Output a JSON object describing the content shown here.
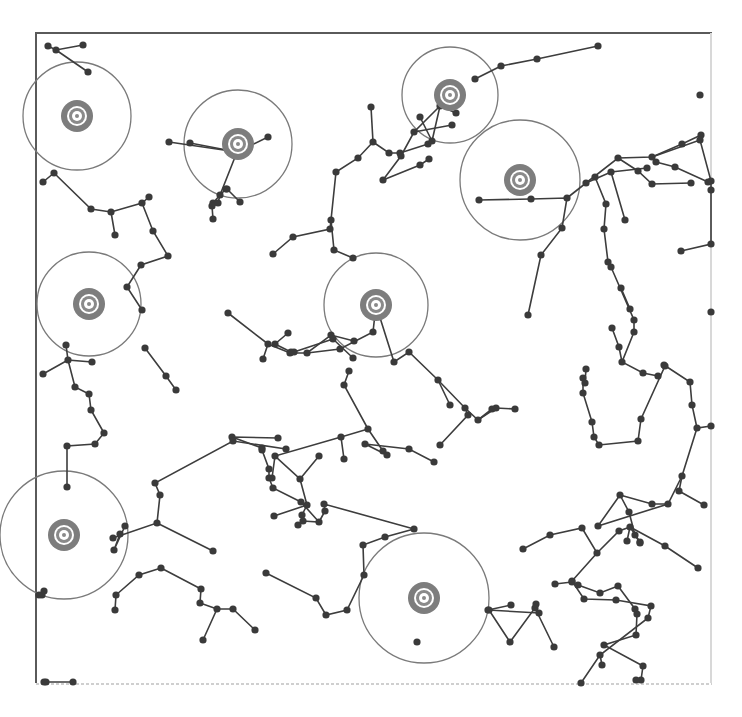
{
  "diagram": {
    "type": "network-tree-with-coverage",
    "colors": {
      "edge": "#3d3d3d",
      "node": "#3a3a3a",
      "range_circle": "#7a7a7a",
      "target": "#7d7d7d",
      "frame": "#5a5a5a"
    },
    "frame": {
      "x1": 35,
      "y1": 33,
      "x2": 740,
      "y2": 683
    },
    "targets": [
      {
        "id": "t1",
        "x": 77,
        "y": 116,
        "r": 54
      },
      {
        "id": "t2",
        "x": 238,
        "y": 144,
        "r": 54
      },
      {
        "id": "t3",
        "x": 450,
        "y": 95,
        "r": 48
      },
      {
        "id": "t4",
        "x": 520,
        "y": 180,
        "r": 60
      },
      {
        "id": "t5",
        "x": 89,
        "y": 304,
        "r": 52
      },
      {
        "id": "t6",
        "x": 376,
        "y": 305,
        "r": 52
      },
      {
        "id": "t7",
        "x": 64,
        "y": 535,
        "r": 64
      },
      {
        "id": "t8",
        "x": 424,
        "y": 598,
        "r": 65
      }
    ],
    "edges": [
      [
        [
          48,
          46
        ],
        [
          56,
          50
        ],
        [
          83,
          45
        ]
      ],
      [
        [
          56,
          50
        ],
        [
          88,
          72
        ]
      ],
      [
        [
          190,
          143
        ],
        [
          237,
          152
        ]
      ],
      [
        [
          169,
          142
        ],
        [
          237,
          152
        ],
        [
          268,
          137
        ]
      ],
      [
        [
          237,
          152
        ],
        [
          220,
          195
        ],
        [
          213,
          203
        ]
      ],
      [
        [
          43,
          182
        ],
        [
          54,
          173
        ],
        [
          91,
          209
        ],
        [
          111,
          212
        ],
        [
          142,
          203
        ],
        [
          149,
          197
        ]
      ],
      [
        [
          111,
          212
        ],
        [
          115,
          235
        ]
      ],
      [
        [
          142,
          203
        ],
        [
          153,
          231
        ],
        [
          168,
          256
        ],
        [
          141,
          265
        ],
        [
          127,
          287
        ],
        [
          142,
          310
        ]
      ],
      [
        [
          226,
          189
        ],
        [
          220,
          195
        ],
        [
          218,
          203
        ]
      ],
      [
        [
          212,
          206
        ],
        [
          213,
          219
        ]
      ],
      [
        [
          227,
          189
        ],
        [
          240,
          202
        ]
      ],
      [
        [
          273,
          254
        ],
        [
          293,
          237
        ],
        [
          330,
          229
        ],
        [
          331,
          220
        ]
      ],
      [
        [
          331,
          220
        ],
        [
          334,
          250
        ],
        [
          353,
          258
        ]
      ],
      [
        [
          371,
          107
        ],
        [
          373,
          142
        ],
        [
          358,
          158
        ],
        [
          336,
          172
        ],
        [
          331,
          220
        ]
      ],
      [
        [
          373,
          142
        ],
        [
          389,
          153
        ],
        [
          400,
          153
        ],
        [
          428,
          144
        ]
      ],
      [
        [
          420,
          117
        ],
        [
          432,
          141
        ]
      ],
      [
        [
          432,
          141
        ],
        [
          440,
          106
        ],
        [
          456,
          113
        ]
      ],
      [
        [
          501,
          66
        ],
        [
          537,
          59
        ],
        [
          598,
          46
        ]
      ],
      [
        [
          501,
          66
        ],
        [
          475,
          79
        ]
      ],
      [
        [
          440,
          106
        ],
        [
          414,
          132
        ],
        [
          401,
          156
        ],
        [
          383,
          180
        ]
      ],
      [
        [
          383,
          180
        ],
        [
          420,
          165
        ],
        [
          429,
          159
        ]
      ],
      [
        [
          414,
          132
        ],
        [
          452,
          125
        ]
      ],
      [
        [
          479,
          200
        ],
        [
          531,
          199
        ],
        [
          567,
          198
        ],
        [
          562,
          228
        ],
        [
          541,
          255
        ],
        [
          528,
          315
        ]
      ],
      [
        [
          567,
          198
        ],
        [
          586,
          183
        ],
        [
          611,
          172
        ],
        [
          647,
          168
        ]
      ],
      [
        [
          586,
          183
        ],
        [
          618,
          158
        ],
        [
          652,
          157
        ],
        [
          682,
          144
        ],
        [
          701,
          135
        ]
      ],
      [
        [
          618,
          158
        ],
        [
          638,
          171
        ],
        [
          652,
          184
        ],
        [
          691,
          183
        ]
      ],
      [
        [
          595,
          177
        ],
        [
          606,
          204
        ],
        [
          604,
          229
        ],
        [
          608,
          262
        ]
      ],
      [
        [
          611,
          172
        ],
        [
          625,
          220
        ]
      ],
      [
        [
          656,
          162
        ],
        [
          675,
          167
        ],
        [
          708,
          182
        ]
      ],
      [
        [
          652,
          157
        ],
        [
          700,
          140
        ],
        [
          714,
          181
        ],
        [
          711,
          190
        ]
      ],
      [
        [
          713,
          190
        ],
        [
          714,
          244
        ],
        [
          681,
          251
        ]
      ],
      [
        [
          608,
          262
        ],
        [
          611,
          267
        ],
        [
          634,
          320
        ],
        [
          634,
          332
        ]
      ],
      [
        [
          634,
          332
        ],
        [
          622,
          362
        ],
        [
          643,
          373
        ],
        [
          658,
          376
        ]
      ],
      [
        [
          622,
          362
        ],
        [
          619,
          347
        ],
        [
          612,
          328
        ]
      ],
      [
        [
          621,
          288
        ],
        [
          630,
          309
        ]
      ],
      [
        [
          228,
          313
        ],
        [
          268,
          344
        ],
        [
          290,
          353
        ],
        [
          307,
          353
        ],
        [
          331,
          335
        ],
        [
          354,
          341
        ]
      ],
      [
        [
          268,
          344
        ],
        [
          263,
          359
        ]
      ],
      [
        [
          307,
          353
        ],
        [
          340,
          349
        ],
        [
          373,
          332
        ],
        [
          376,
          305
        ]
      ],
      [
        [
          66,
          345
        ],
        [
          68,
          360
        ],
        [
          92,
          362
        ]
      ],
      [
        [
          68,
          360
        ],
        [
          43,
          374
        ]
      ],
      [
        [
          68,
          360
        ],
        [
          75,
          387
        ],
        [
          89,
          394
        ],
        [
          91,
          410
        ],
        [
          104,
          433
        ],
        [
          95,
          444
        ],
        [
          67,
          446
        ],
        [
          67,
          487
        ]
      ],
      [
        [
          145,
          348
        ],
        [
          166,
          376
        ],
        [
          176,
          390
        ]
      ],
      [
        [
          288,
          333
        ],
        [
          275,
          344
        ],
        [
          291,
          352
        ]
      ],
      [
        [
          294,
          352
        ],
        [
          333,
          339
        ]
      ],
      [
        [
          376,
          305
        ],
        [
          394,
          362
        ],
        [
          409,
          352
        ],
        [
          438,
          380
        ],
        [
          465,
          408
        ],
        [
          478,
          420
        ],
        [
          496,
          408
        ]
      ],
      [
        [
          438,
          380
        ],
        [
          450,
          405
        ]
      ],
      [
        [
          465,
          408
        ],
        [
          468,
          415
        ],
        [
          440,
          445
        ]
      ],
      [
        [
          478,
          420
        ],
        [
          492,
          409
        ]
      ],
      [
        [
          496,
          408
        ],
        [
          515,
          409
        ]
      ],
      [
        [
          333,
          339
        ],
        [
          353,
          358
        ]
      ],
      [
        [
          349,
          371
        ],
        [
          344,
          385
        ],
        [
          368,
          429
        ],
        [
          383,
          451
        ]
      ],
      [
        [
          368,
          429
        ],
        [
          341,
          437
        ],
        [
          344,
          459
        ]
      ],
      [
        [
          341,
          437
        ],
        [
          275,
          456
        ],
        [
          300,
          479
        ],
        [
          307,
          505
        ],
        [
          274,
          516
        ]
      ],
      [
        [
          300,
          479
        ],
        [
          319,
          456
        ]
      ],
      [
        [
          307,
          505
        ],
        [
          302,
          515
        ]
      ],
      [
        [
          272,
          478
        ],
        [
          275,
          456
        ]
      ],
      [
        [
          387,
          455
        ],
        [
          365,
          444
        ],
        [
          409,
          449
        ],
        [
          434,
          462
        ]
      ],
      [
        [
          278,
          438
        ],
        [
          232,
          437
        ],
        [
          262,
          448
        ]
      ],
      [
        [
          286,
          449
        ],
        [
          233,
          441
        ],
        [
          155,
          483
        ],
        [
          160,
          495
        ],
        [
          157,
          523
        ],
        [
          113,
          538
        ]
      ],
      [
        [
          157,
          523
        ],
        [
          213,
          551
        ]
      ],
      [
        [
          262,
          450
        ],
        [
          269,
          469
        ],
        [
          269,
          478
        ]
      ],
      [
        [
          269,
          478
        ],
        [
          273,
          488
        ],
        [
          301,
          502
        ]
      ],
      [
        [
          301,
          502
        ],
        [
          319,
          522
        ],
        [
          303,
          521
        ],
        [
          298,
          525
        ]
      ],
      [
        [
          319,
          522
        ],
        [
          325,
          511
        ],
        [
          324,
          504
        ],
        [
          414,
          529
        ]
      ],
      [
        [
          583,
          378
        ],
        [
          583,
          393
        ],
        [
          592,
          422
        ],
        [
          594,
          437
        ],
        [
          599,
          445
        ],
        [
          638,
          441
        ],
        [
          641,
          419
        ],
        [
          665,
          366
        ]
      ],
      [
        [
          585,
          383
        ],
        [
          586,
          369
        ]
      ],
      [
        [
          664,
          365
        ],
        [
          690,
          382
        ],
        [
          692,
          405
        ],
        [
          697,
          428
        ],
        [
          711,
          426
        ]
      ],
      [
        [
          697,
          428
        ],
        [
          682,
          476
        ],
        [
          679,
          491
        ],
        [
          704,
          505
        ]
      ],
      [
        [
          682,
          476
        ],
        [
          668,
          504
        ],
        [
          598,
          526
        ],
        [
          620,
          495
        ]
      ],
      [
        [
          668,
          504
        ],
        [
          652,
          504
        ],
        [
          620,
          495
        ]
      ],
      [
        [
          620,
          495
        ],
        [
          629,
          512
        ]
      ],
      [
        [
          640,
          542
        ],
        [
          630,
          527
        ],
        [
          627,
          541
        ]
      ],
      [
        [
          629,
          512
        ],
        [
          635,
          535
        ],
        [
          640,
          543
        ]
      ],
      [
        [
          523,
          549
        ],
        [
          550,
          535
        ],
        [
          582,
          528
        ],
        [
          597,
          553
        ],
        [
          619,
          531
        ],
        [
          630,
          527
        ]
      ],
      [
        [
          597,
          553
        ],
        [
          572,
          581
        ],
        [
          584,
          599
        ],
        [
          616,
          600
        ],
        [
          651,
          606
        ],
        [
          648,
          618
        ],
        [
          600,
          655
        ],
        [
          581,
          720
        ]
      ],
      [
        [
          698,
          568
        ],
        [
          665,
          546
        ],
        [
          630,
          527
        ]
      ],
      [
        [
          600,
          655
        ],
        [
          602,
          665
        ]
      ],
      [
        [
          511,
          605
        ],
        [
          488,
          610
        ],
        [
          539,
          613
        ]
      ],
      [
        [
          489,
          610
        ],
        [
          510,
          642
        ],
        [
          535,
          608
        ],
        [
          536,
          604
        ]
      ],
      [
        [
          535,
          608
        ],
        [
          554,
          647
        ]
      ],
      [
        [
          555,
          584
        ],
        [
          572,
          582
        ],
        [
          578,
          585
        ],
        [
          600,
          593
        ],
        [
          618,
          586
        ]
      ],
      [
        [
          618,
          586
        ],
        [
          635,
          609
        ],
        [
          637,
          614
        ],
        [
          636,
          635
        ],
        [
          604,
          645
        ],
        [
          643,
          666
        ],
        [
          641,
          680
        ],
        [
          636,
          680
        ]
      ],
      [
        [
          116,
          595
        ],
        [
          139,
          575
        ],
        [
          161,
          568
        ]
      ],
      [
        [
          161,
          568
        ],
        [
          201,
          589
        ],
        [
          200,
          603
        ],
        [
          217,
          609
        ]
      ],
      [
        [
          217,
          609
        ],
        [
          233,
          609
        ],
        [
          255,
          630
        ]
      ],
      [
        [
          217,
          609
        ],
        [
          203,
          640
        ]
      ],
      [
        [
          116,
          595
        ],
        [
          115,
          610
        ]
      ],
      [
        [
          120,
          534
        ],
        [
          114,
          550
        ],
        [
          125,
          526
        ]
      ],
      [
        [
          46,
          682
        ],
        [
          73,
          682
        ]
      ],
      [
        [
          42,
          595
        ],
        [
          44,
          591
        ]
      ],
      [
        [
          266,
          573
        ],
        [
          316,
          598
        ],
        [
          326,
          615
        ],
        [
          347,
          610
        ],
        [
          364,
          575
        ]
      ],
      [
        [
          364,
          575
        ],
        [
          363,
          545
        ],
        [
          385,
          537
        ],
        [
          414,
          529
        ]
      ]
    ],
    "isolated_nodes": [
      [
        700,
        95
      ],
      [
        417,
        642
      ],
      [
        720,
        312
      ],
      [
        39,
        595
      ],
      [
        44,
        682
      ]
    ]
  }
}
